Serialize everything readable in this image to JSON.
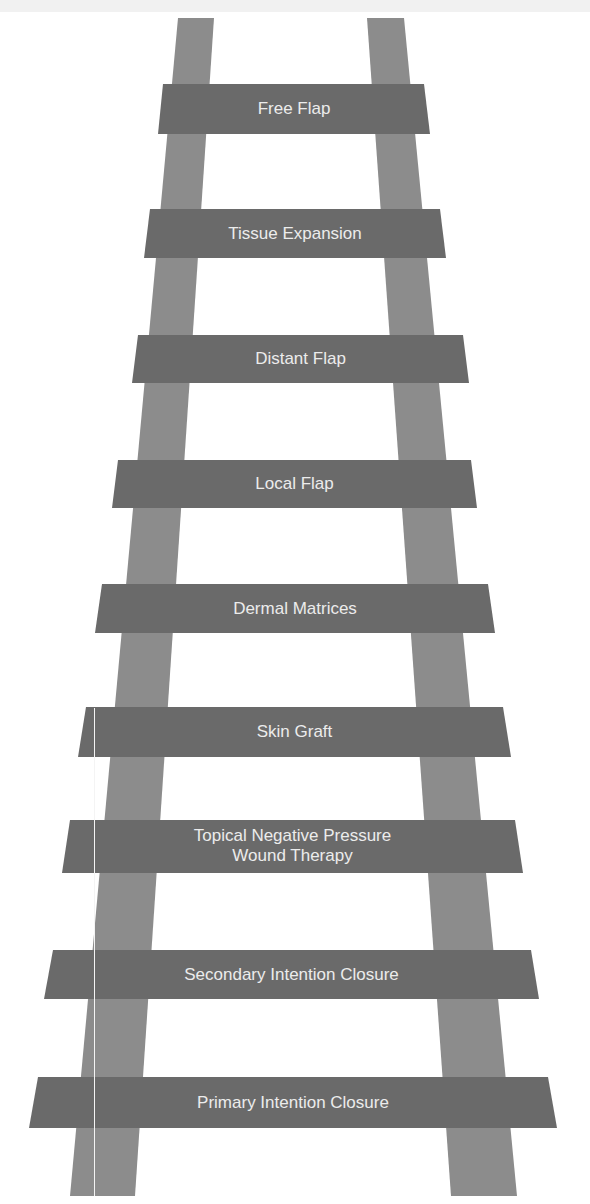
{
  "diagram": {
    "type": "ladder",
    "colors": {
      "background": "#ffffff",
      "rail": "#8c8c8c",
      "rung": "#6a6a6a",
      "label": "#ececec"
    },
    "rungs": [
      {
        "label": "Free Flap",
        "lines": [
          "Free Flap"
        ]
      },
      {
        "label": "Tissue Expansion",
        "lines": [
          "Tissue Expansion"
        ]
      },
      {
        "label": "Distant Flap",
        "lines": [
          "Distant Flap"
        ]
      },
      {
        "label": "Local Flap",
        "lines": [
          "Local Flap"
        ]
      },
      {
        "label": "Dermal Matrices",
        "lines": [
          "Dermal Matrices"
        ]
      },
      {
        "label": "Skin Graft",
        "lines": [
          "Skin Graft"
        ]
      },
      {
        "label": "Topical Negative Pressure Wound Therapy",
        "lines": [
          "Topical Negative Pressure",
          "Wound Therapy"
        ]
      },
      {
        "label": "Secondary Intention Closure",
        "lines": [
          "Secondary Intention Closure"
        ]
      },
      {
        "label": "Primary Intention Closure",
        "lines": [
          "Primary Intention Closure"
        ]
      }
    ]
  }
}
